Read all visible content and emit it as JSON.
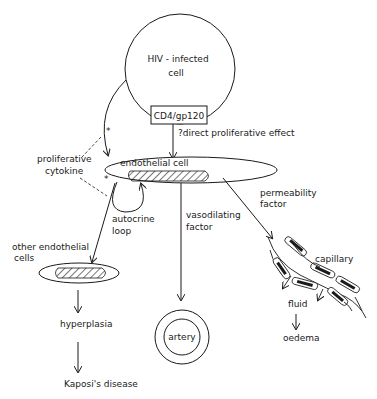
{
  "diagram": {
    "nodes": {
      "hiv_cell": {
        "line1": "HIV - infected",
        "line2": "cell"
      },
      "receptor": "CD4/gp120",
      "endothelial_cell": "endothelial cell",
      "artery": "artery",
      "capillary": "capillary",
      "fluid": "fluid",
      "oedema": "oedema",
      "other_cells": {
        "line1": "other endothelial",
        "line2": "cells"
      },
      "hyperplasia": "hyperplasia",
      "kaposi": "Kaposi's disease"
    },
    "edge_labels": {
      "direct_effect": "?direct proliferative effect",
      "proliferative_cytokine": {
        "line1": "proliferative",
        "line2": "cytokine"
      },
      "autocrine_loop": {
        "line1": "autocrine",
        "line2": "loop"
      },
      "vasodilating_factor": {
        "line1": "vasodilating",
        "line2": "factor"
      },
      "permeability_factor": {
        "line1": "permeability",
        "line2": "factor"
      },
      "asterisk": "*"
    }
  }
}
